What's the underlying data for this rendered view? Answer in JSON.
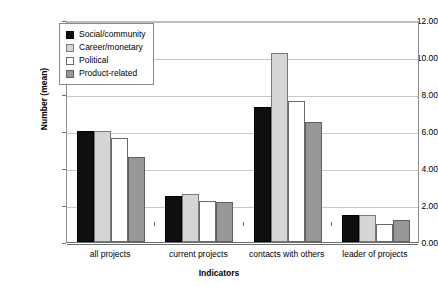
{
  "chart_data": {
    "type": "bar",
    "title": "",
    "xlabel": "Indicators",
    "ylabel": "Number (mean)",
    "ylim": [
      0,
      12
    ],
    "ytick_step": 2,
    "ytick_labels": [
      "12.00",
      "10.00",
      "8.00",
      "6.00",
      "4.00",
      "2.00",
      "0.00"
    ],
    "ytick_values": [
      12,
      10,
      8,
      6,
      4,
      2,
      0
    ],
    "grid": true,
    "legend_position": "upper-left-inside",
    "categories": [
      "all projects",
      "current projects",
      "contacts with others",
      "leader of projects"
    ],
    "series": [
      {
        "name": "Social/community",
        "color": "#100f0f",
        "values": [
          6.0,
          2.5,
          7.3,
          1.45
        ]
      },
      {
        "name": "Career/monetary",
        "color": "#d5d5d5",
        "values": [
          6.0,
          2.6,
          10.2,
          1.45
        ]
      },
      {
        "name": "Political",
        "color": "#ffffff",
        "values": [
          5.6,
          2.2,
          7.6,
          1.0
        ]
      },
      {
        "name": "Product-related",
        "color": "#989898",
        "values": [
          4.6,
          2.15,
          6.5,
          1.2
        ]
      }
    ]
  },
  "legend": {
    "items": [
      {
        "label": "Social/community"
      },
      {
        "label": "Career/monetary"
      },
      {
        "label": "Political"
      },
      {
        "label": "Product-related"
      }
    ]
  }
}
